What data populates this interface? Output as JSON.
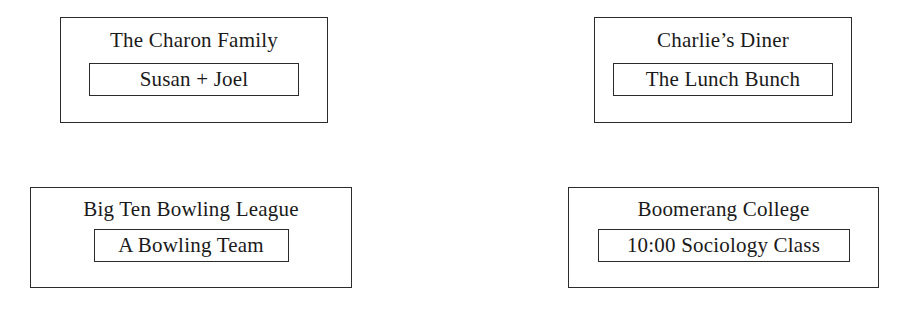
{
  "diagram": {
    "background_color": "#ffffff",
    "line_color": "#2b2b2b",
    "text_color": "#1a1a1a",
    "groups": [
      {
        "id": "charon-family",
        "title": "The Charon Family",
        "subgroup": "Susan  +  Joel"
      },
      {
        "id": "charlies-diner",
        "title": "Charlie’s Diner",
        "subgroup": "The Lunch Bunch"
      },
      {
        "id": "bowling-league",
        "title": "Big Ten Bowling League",
        "subgroup": "A Bowling Team"
      },
      {
        "id": "boomerang-college",
        "title": "Boomerang College",
        "subgroup": "10:00 Sociology Class"
      }
    ]
  }
}
